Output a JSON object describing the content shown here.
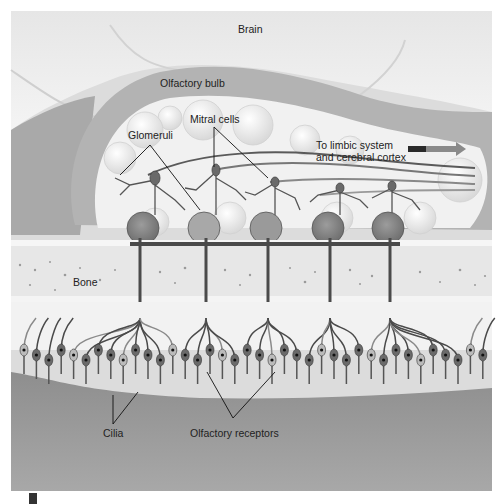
{
  "figure": {
    "labels": {
      "brain": "Brain",
      "olfactory_bulb": "Olfactory bulb",
      "mitral_cells": "Mitral cells",
      "glomeruli": "Glomeruli",
      "to_limbic_line1": "To limbic system",
      "to_limbic_line2": "and cerebral cortex",
      "bone": "Bone",
      "cilia": "Cilia",
      "olfactory_receptors": "Olfactory receptors"
    },
    "colors": {
      "arrow_dark": "#2a2a2a",
      "arrow_red": "#8a8a8a",
      "brain": "#ececec",
      "bulb_rim": "#b5b5b5",
      "bulb_inner": "#f2f2f2",
      "bone": "#e6e6e6",
      "epithelium": "#9a9a9a",
      "neuron": "#4a4a4a"
    },
    "counts": {
      "glomeruli": 5,
      "mitral_cells": 5
    }
  }
}
